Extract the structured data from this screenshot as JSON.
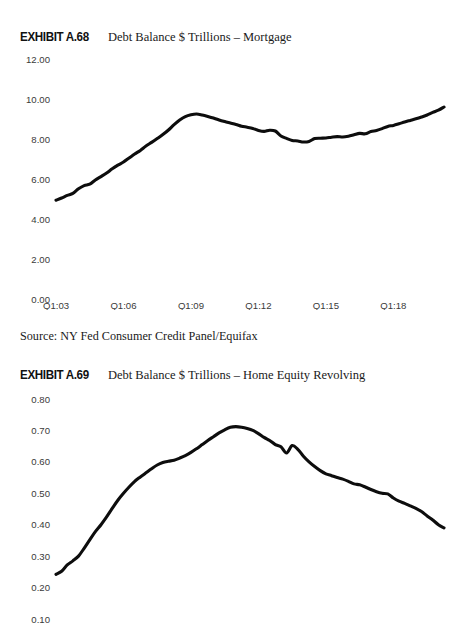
{
  "page": {
    "background": "#ffffff",
    "line_color": "#0d0d0d",
    "tick_color": "#3a3a3a"
  },
  "exhibits": [
    {
      "tag": "EXHIBIT A.68",
      "description": "Debt Balance $ Trillions – Mortgage",
      "source": "Source: NY Fed Consumer Credit Panel/Equifax"
    },
    {
      "tag": "EXHIBIT A.69",
      "description": "Debt Balance $ Trillions – Home Equity Revolving",
      "source": ""
    }
  ],
  "chart_data": [
    {
      "type": "line",
      "title": "Debt Balance $ Trillions – Mortgage",
      "xlabel": "",
      "ylabel": "",
      "ylim": [
        0.0,
        12.0
      ],
      "ytick_labels": [
        "12.00",
        "10.00",
        "8.00",
        "6.00",
        "4.00",
        "2.00",
        "0.00"
      ],
      "ytick_values": [
        12.0,
        10.0,
        8.0,
        6.0,
        4.0,
        2.0,
        0.0
      ],
      "xtick_labels": [
        "Q1:03",
        "Q1:06",
        "Q1:09",
        "Q1:12",
        "Q1:15",
        "Q1:18"
      ],
      "xtick_values": [
        2003.0,
        2006.0,
        2009.0,
        2012.0,
        2015.0,
        2018.0
      ],
      "xlim": [
        2003.0,
        2020.25
      ],
      "grid": false,
      "legend": "none",
      "x": [
        2003.0,
        2003.25,
        2003.5,
        2003.75,
        2004.0,
        2004.25,
        2004.5,
        2004.75,
        2005.0,
        2005.25,
        2005.5,
        2005.75,
        2006.0,
        2006.25,
        2006.5,
        2006.75,
        2007.0,
        2007.25,
        2007.5,
        2007.75,
        2008.0,
        2008.25,
        2008.5,
        2008.75,
        2009.0,
        2009.25,
        2009.5,
        2009.75,
        2010.0,
        2010.25,
        2010.5,
        2010.75,
        2011.0,
        2011.25,
        2011.5,
        2011.75,
        2012.0,
        2012.25,
        2012.5,
        2012.75,
        2013.0,
        2013.25,
        2013.5,
        2013.75,
        2014.0,
        2014.25,
        2014.5,
        2014.75,
        2015.0,
        2015.25,
        2015.5,
        2015.75,
        2016.0,
        2016.25,
        2016.5,
        2016.75,
        2017.0,
        2017.25,
        2017.5,
        2017.75,
        2018.0,
        2018.25,
        2018.5,
        2018.75,
        2019.0,
        2019.25,
        2019.5,
        2019.75,
        2020.0,
        2020.25
      ],
      "values": [
        4.94,
        5.05,
        5.18,
        5.28,
        5.51,
        5.67,
        5.74,
        5.95,
        6.12,
        6.3,
        6.51,
        6.69,
        6.85,
        7.05,
        7.25,
        7.43,
        7.65,
        7.83,
        8.02,
        8.22,
        8.45,
        8.72,
        8.95,
        9.12,
        9.21,
        9.25,
        9.2,
        9.13,
        9.05,
        8.95,
        8.87,
        8.8,
        8.73,
        8.64,
        8.59,
        8.53,
        8.43,
        8.38,
        8.44,
        8.4,
        8.15,
        8.03,
        7.93,
        7.9,
        7.85,
        7.88,
        8.02,
        8.04,
        8.05,
        8.09,
        8.12,
        8.1,
        8.14,
        8.21,
        8.28,
        8.26,
        8.37,
        8.43,
        8.52,
        8.63,
        8.68,
        8.76,
        8.85,
        8.93,
        9.01,
        9.1,
        9.2,
        9.33,
        9.44,
        9.6
      ]
    },
    {
      "type": "line",
      "title": "Debt Balance $ Trillions – Home Equity Revolving",
      "xlabel": "",
      "ylabel": "",
      "ylim": [
        0.1,
        0.8
      ],
      "ytick_labels": [
        "0.80",
        "0.70",
        "0.60",
        "0.50",
        "0.40",
        "0.30",
        "0.20",
        "0.10"
      ],
      "ytick_values": [
        0.8,
        0.7,
        0.6,
        0.5,
        0.4,
        0.3,
        0.2,
        0.1
      ],
      "xtick_labels": [],
      "xtick_values": [],
      "xlim": [
        2003.0,
        2020.25
      ],
      "grid": false,
      "legend": "none",
      "note": "x-axis tick labels are cropped off the bottom of the image",
      "x": [
        2003.0,
        2003.25,
        2003.5,
        2003.75,
        2004.0,
        2004.25,
        2004.5,
        2004.75,
        2005.0,
        2005.25,
        2005.5,
        2005.75,
        2006.0,
        2006.25,
        2006.5,
        2006.75,
        2007.0,
        2007.25,
        2007.5,
        2007.75,
        2008.0,
        2008.25,
        2008.5,
        2008.75,
        2009.0,
        2009.25,
        2009.5,
        2009.75,
        2010.0,
        2010.25,
        2010.5,
        2010.75,
        2011.0,
        2011.25,
        2011.5,
        2011.75,
        2012.0,
        2012.25,
        2012.5,
        2012.75,
        2013.0,
        2013.25,
        2013.5,
        2013.75,
        2014.0,
        2014.25,
        2014.5,
        2014.75,
        2015.0,
        2015.25,
        2015.5,
        2015.75,
        2016.0,
        2016.25,
        2016.5,
        2016.75,
        2017.0,
        2017.25,
        2017.5,
        2017.75,
        2018.0,
        2018.25,
        2018.5,
        2018.75,
        2019.0,
        2019.25,
        2019.5,
        2019.75,
        2020.0,
        2020.25
      ],
      "values": [
        0.242,
        0.252,
        0.272,
        0.285,
        0.3,
        0.325,
        0.352,
        0.378,
        0.4,
        0.425,
        0.452,
        0.478,
        0.5,
        0.52,
        0.538,
        0.552,
        0.565,
        0.578,
        0.59,
        0.598,
        0.602,
        0.605,
        0.612,
        0.62,
        0.63,
        0.642,
        0.655,
        0.668,
        0.68,
        0.692,
        0.702,
        0.71,
        0.712,
        0.71,
        0.706,
        0.7,
        0.69,
        0.678,
        0.668,
        0.655,
        0.648,
        0.628,
        0.652,
        0.64,
        0.618,
        0.6,
        0.585,
        0.572,
        0.562,
        0.556,
        0.55,
        0.545,
        0.538,
        0.53,
        0.527,
        0.52,
        0.512,
        0.505,
        0.5,
        0.498,
        0.485,
        0.475,
        0.468,
        0.46,
        0.452,
        0.442,
        0.428,
        0.415,
        0.4,
        0.39
      ]
    }
  ]
}
